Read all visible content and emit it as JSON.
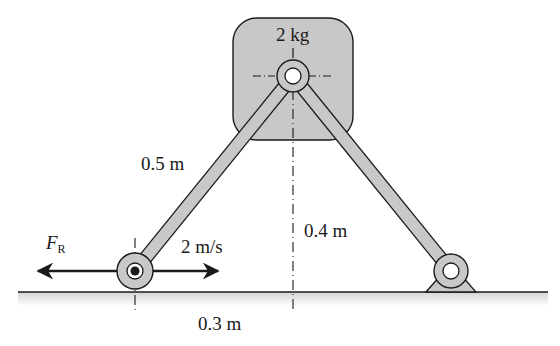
{
  "diagram": {
    "type": "mechanism",
    "block": {
      "mass_label": "2 kg"
    },
    "labels": {
      "bar_length": "0.5 m",
      "height": "0.4 m",
      "horizontal_offset": "0.3 m",
      "velocity": "2 m/s",
      "force_symbol": "F",
      "force_subscript": "R"
    },
    "colors": {
      "fill_gray": "#c8c8c8",
      "stroke": "#1a1a1a",
      "ground_shade": "#e2e2e2"
    }
  }
}
